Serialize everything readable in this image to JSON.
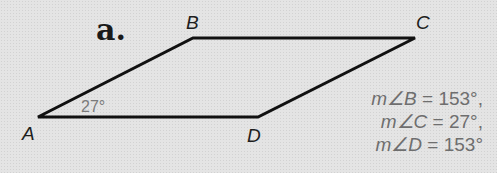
{
  "figure": {
    "part_label": "a.",
    "shape": "parallelogram",
    "vertices": [
      {
        "name": "A",
        "x": 38,
        "y": 117
      },
      {
        "name": "B",
        "x": 193,
        "y": 38
      },
      {
        "name": "C",
        "x": 415,
        "y": 38
      },
      {
        "name": "D",
        "x": 258,
        "y": 117
      }
    ],
    "given_angle": {
      "vertex": "A",
      "label": "27°"
    },
    "measures": [
      {
        "var": "m∠B",
        "eq": " = 153°,"
      },
      {
        "var": "m∠C",
        "eq": " = 27°,"
      },
      {
        "var": "m∠D",
        "eq": " = 153°"
      }
    ],
    "colors": {
      "line": "#111111",
      "measure_text": "#6e6e6e",
      "background": "#e4e4e4"
    }
  }
}
